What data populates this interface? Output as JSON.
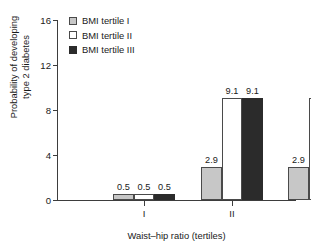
{
  "chart_data": {
    "type": "bar",
    "title": "",
    "subtitle": "",
    "xlabel": "Waist–hip ratio (tertiles)",
    "ylabel": "Probability of developing\ntype 2 diabetes",
    "categories": [
      "I",
      "II",
      "III"
    ],
    "series": [
      {
        "name": "BMI tertile I",
        "values": [
          0.5,
          2.9,
          2.9
        ],
        "color": "#c7c7c7"
      },
      {
        "name": "BMI tertile II",
        "values": [
          0.5,
          9.1,
          9.1
        ],
        "color": "#ffffff"
      },
      {
        "name": "BMI tertile III",
        "values": [
          0.5,
          9.1,
          15.2
        ],
        "color": "#2b2b2b"
      }
    ],
    "data_labels": [
      [
        "0.5",
        "0.5",
        "0.5"
      ],
      [
        "2.9",
        "9.1",
        "9.1"
      ],
      [
        "2.9",
        "9.1",
        "15.2"
      ]
    ],
    "ylim": [
      0,
      16
    ],
    "yticks": [
      0,
      4,
      8,
      12,
      16
    ],
    "ytick_labels": [
      "0",
      "4",
      "8",
      "12",
      "16"
    ],
    "grid": false,
    "legend_position": "top-left",
    "legend_entries": [
      "BMI tertile I",
      "BMI tertile II",
      "BMI tertile III"
    ]
  }
}
